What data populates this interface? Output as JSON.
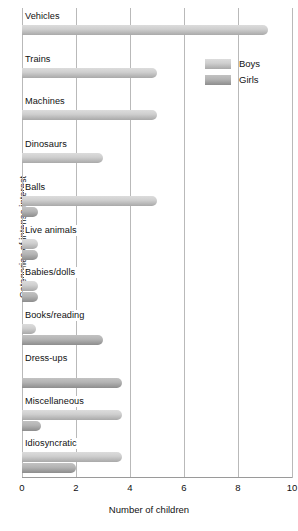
{
  "chart_data": {
    "type": "bar",
    "orientation": "horizontal",
    "title": "",
    "xlabel": "Number of children",
    "ylabel": "Categories of intense interest",
    "xlim": [
      0,
      10
    ],
    "xticks": [
      "0",
      "2",
      "4",
      "6",
      "8",
      "10"
    ],
    "grid": true,
    "legend_position": "top-right",
    "categories": [
      "Vehicles",
      "Trains",
      "Machines",
      "Dinosaurs",
      "Balls",
      "Live animals",
      "Babies/dolls",
      "Books/reading",
      "Dress-ups",
      "Miscellaneous",
      "Idiosyncratic"
    ],
    "series": [
      {
        "name": "Boys",
        "color": "#cfcfcf",
        "values": [
          9.1,
          5.0,
          5.0,
          3.0,
          5.0,
          0.6,
          0.6,
          0.5,
          0,
          3.7,
          3.7
        ]
      },
      {
        "name": "Girls",
        "color": "#b4b4b4",
        "values": [
          0,
          0,
          0,
          0,
          0.6,
          0.6,
          0.6,
          3.0,
          3.7,
          0.7,
          2.0
        ]
      }
    ]
  },
  "legend": {
    "items": [
      {
        "label": "Boys"
      },
      {
        "label": "Girls"
      }
    ]
  }
}
